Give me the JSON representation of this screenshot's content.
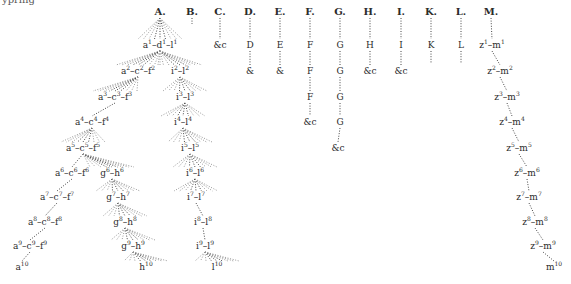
{
  "corner_text": "ypring",
  "species_headers": [
    "A.",
    "B.",
    "C.",
    "D.",
    "E.",
    "F.",
    "G.",
    "H.",
    "I.",
    "K.",
    "L.",
    "M."
  ],
  "nodes": [
    {
      "id": "A",
      "x": 160,
      "y": 12,
      "text": "A.",
      "head": true
    },
    {
      "id": "B",
      "x": 192,
      "y": 12,
      "text": "B.",
      "head": true
    },
    {
      "id": "C",
      "x": 220,
      "y": 12,
      "text": "C.",
      "head": true
    },
    {
      "id": "D",
      "x": 250,
      "y": 12,
      "text": "D.",
      "head": true
    },
    {
      "id": "E",
      "x": 280,
      "y": 12,
      "text": "E.",
      "head": true
    },
    {
      "id": "F",
      "x": 310,
      "y": 12,
      "text": "F.",
      "head": true
    },
    {
      "id": "G",
      "x": 340,
      "y": 12,
      "text": "G.",
      "head": true
    },
    {
      "id": "H",
      "x": 370,
      "y": 12,
      "text": "H.",
      "head": true
    },
    {
      "id": "I",
      "x": 401,
      "y": 12,
      "text": "I.",
      "head": true
    },
    {
      "id": "K",
      "x": 431,
      "y": 12,
      "text": "K.",
      "head": true
    },
    {
      "id": "L",
      "x": 461,
      "y": 12,
      "text": "L.",
      "head": true
    },
    {
      "id": "M",
      "x": 491,
      "y": 12,
      "text": "M.",
      "head": true
    },
    {
      "id": "C1",
      "x": 220,
      "y": 45,
      "text": "&c"
    },
    {
      "id": "D1",
      "x": 250,
      "y": 45,
      "text": "D"
    },
    {
      "id": "D2",
      "x": 250,
      "y": 71,
      "text": "&"
    },
    {
      "id": "E1",
      "x": 280,
      "y": 45,
      "text": "E"
    },
    {
      "id": "E2",
      "x": 280,
      "y": 71,
      "text": "&"
    },
    {
      "id": "F1",
      "x": 310,
      "y": 45,
      "text": "F"
    },
    {
      "id": "F2",
      "x": 310,
      "y": 71,
      "text": "F"
    },
    {
      "id": "F3",
      "x": 310,
      "y": 97,
      "text": "F"
    },
    {
      "id": "F4",
      "x": 310,
      "y": 122,
      "text": "&c"
    },
    {
      "id": "G1",
      "x": 340,
      "y": 45,
      "text": "G"
    },
    {
      "id": "G2",
      "x": 340,
      "y": 71,
      "text": "G"
    },
    {
      "id": "G3",
      "x": 340,
      "y": 97,
      "text": "G"
    },
    {
      "id": "G4",
      "x": 340,
      "y": 122,
      "text": "G"
    },
    {
      "id": "G5",
      "x": 338,
      "y": 148,
      "text": "&c"
    },
    {
      "id": "H1",
      "x": 370,
      "y": 45,
      "text": "H"
    },
    {
      "id": "H2",
      "x": 370,
      "y": 71,
      "text": "&c"
    },
    {
      "id": "I1",
      "x": 401,
      "y": 45,
      "text": "I"
    },
    {
      "id": "I2",
      "x": 401,
      "y": 71,
      "text": "&c"
    },
    {
      "id": "K1",
      "x": 431,
      "y": 45,
      "text": "K"
    },
    {
      "id": "L1",
      "x": 461,
      "y": 45,
      "text": "L"
    },
    {
      "id": "a1",
      "x": 160,
      "y": 45,
      "text": "a",
      "sup": "1",
      "rest": "–d",
      "sup2": "1",
      "rest2": "–l",
      "sup3": "1"
    },
    {
      "id": "a2",
      "x": 138,
      "y": 71,
      "text": "a",
      "sup": "2",
      "rest": "–c",
      "sup2": "2",
      "rest2": "–f",
      "sup3": "2"
    },
    {
      "id": "i2",
      "x": 180,
      "y": 71,
      "text": "i",
      "sup": "2",
      "rest": "–l",
      "sup2": "2"
    },
    {
      "id": "a3",
      "x": 115,
      "y": 97,
      "text": "a",
      "sup": "3",
      "rest": "–c",
      "sup2": "3",
      "rest2": "–f",
      "sup3": "3"
    },
    {
      "id": "i3",
      "x": 185,
      "y": 97,
      "text": "i",
      "sup": "3",
      "rest": "–l",
      "sup2": "3"
    },
    {
      "id": "a4",
      "x": 92,
      "y": 122,
      "text": "a",
      "sup": "4",
      "rest": "–c",
      "sup2": "4",
      "rest2": "–f",
      "sup3": "4"
    },
    {
      "id": "i4",
      "x": 183,
      "y": 122,
      "text": "i",
      "sup": "4",
      "rest": "–l",
      "sup2": "4"
    },
    {
      "id": "a5",
      "x": 83,
      "y": 148,
      "text": "a",
      "sup": "5",
      "rest": "–c",
      "sup2": "5",
      "rest2": "–f",
      "sup3": "5"
    },
    {
      "id": "i5",
      "x": 190,
      "y": 148,
      "text": "i",
      "sup": "5",
      "rest": "–l",
      "sup2": "5"
    },
    {
      "id": "a6",
      "x": 72,
      "y": 173,
      "text": "a",
      "sup": "6",
      "rest": "–c",
      "sup2": "6",
      "rest2": "–f",
      "sup3": "6"
    },
    {
      "id": "g6",
      "x": 112,
      "y": 173,
      "text": "g",
      "sup": "6",
      "rest": "–h",
      "sup2": "6"
    },
    {
      "id": "i6",
      "x": 195,
      "y": 173,
      "text": "i",
      "sup": "6",
      "rest": "–l",
      "sup2": "6"
    },
    {
      "id": "a7",
      "x": 57,
      "y": 197,
      "text": "a",
      "sup": "7",
      "rest": "–c",
      "sup2": "7",
      "rest2": "–f",
      "sup3": "7"
    },
    {
      "id": "g7",
      "x": 118,
      "y": 197,
      "text": "g",
      "sup": "7",
      "rest": "–h",
      "sup2": "7"
    },
    {
      "id": "i7",
      "x": 196,
      "y": 197,
      "text": "i",
      "sup": "7",
      "rest": "–l",
      "sup2": "7"
    },
    {
      "id": "a8",
      "x": 45,
      "y": 222,
      "text": "a",
      "sup": "8",
      "rest": "–c",
      "sup2": "8",
      "rest2": "–f",
      "sup3": "8"
    },
    {
      "id": "g8",
      "x": 125,
      "y": 222,
      "text": "g",
      "sup": "8",
      "rest": "–h",
      "sup2": "8"
    },
    {
      "id": "i8",
      "x": 203,
      "y": 222,
      "text": "i",
      "sup": "8",
      "rest": "–l",
      "sup2": "8"
    },
    {
      "id": "a9",
      "x": 30,
      "y": 246,
      "text": "a",
      "sup": "9",
      "rest": "–c",
      "sup2": "9",
      "rest2": "–f",
      "sup3": "9"
    },
    {
      "id": "g9",
      "x": 133,
      "y": 246,
      "text": "g",
      "sup": "9",
      "rest": "–h",
      "sup2": "9"
    },
    {
      "id": "i9",
      "x": 205,
      "y": 246,
      "text": "i",
      "sup": "9",
      "rest": "–l",
      "sup2": "9"
    },
    {
      "id": "a10",
      "x": 22,
      "y": 267,
      "text": "a",
      "sup": "10"
    },
    {
      "id": "h10",
      "x": 146,
      "y": 267,
      "text": "h",
      "sup": "10"
    },
    {
      "id": "l10",
      "x": 217,
      "y": 267,
      "text": "l",
      "sup": "10"
    },
    {
      "id": "z1",
      "x": 492,
      "y": 45,
      "text": "z",
      "sup": "1",
      "rest": "–m",
      "sup2": "1"
    },
    {
      "id": "z2",
      "x": 500,
      "y": 71,
      "text": "z",
      "sup": "2",
      "rest": "–m",
      "sup2": "2"
    },
    {
      "id": "z3",
      "x": 507,
      "y": 97,
      "text": "z",
      "sup": "3",
      "rest": "–m",
      "sup2": "3"
    },
    {
      "id": "z4",
      "x": 512,
      "y": 122,
      "text": "z",
      "sup": "4",
      "rest": "–m",
      "sup2": "4"
    },
    {
      "id": "z5",
      "x": 519,
      "y": 148,
      "text": "z",
      "sup": "5",
      "rest": "–m",
      "sup2": "5"
    },
    {
      "id": "z6",
      "x": 527,
      "y": 173,
      "text": "z",
      "sup": "6",
      "rest": "–m",
      "sup2": "6"
    },
    {
      "id": "z7",
      "x": 529,
      "y": 197,
      "text": "z",
      "sup": "7",
      "rest": "–m",
      "sup2": "7"
    },
    {
      "id": "z8",
      "x": 535,
      "y": 222,
      "text": "z",
      "sup": "8",
      "rest": "–m",
      "sup2": "8"
    },
    {
      "id": "z9",
      "x": 543,
      "y": 246,
      "text": "z",
      "sup": "9",
      "rest": "–m",
      "sup2": "9"
    },
    {
      "id": "m10",
      "x": 554,
      "y": 267,
      "text": "m",
      "sup": "10"
    }
  ],
  "edges": [
    [
      "A",
      "a1",
      "fan"
    ],
    [
      "B",
      "B_end",
      "line"
    ],
    [
      "C",
      "C1",
      "line"
    ],
    [
      "D",
      "D1",
      "line"
    ],
    [
      "D1",
      "D2",
      "line"
    ],
    [
      "E",
      "E1",
      "line"
    ],
    [
      "E1",
      "E2",
      "line"
    ],
    [
      "F",
      "F1",
      "line"
    ],
    [
      "F1",
      "F2",
      "line"
    ],
    [
      "F2",
      "F3",
      "line"
    ],
    [
      "F3",
      "F4",
      "line"
    ],
    [
      "G",
      "G1",
      "line"
    ],
    [
      "G1",
      "G2",
      "line"
    ],
    [
      "G2",
      "G3",
      "line"
    ],
    [
      "G3",
      "G4",
      "line"
    ],
    [
      "G4",
      "G5",
      "line"
    ],
    [
      "H",
      "H1",
      "line"
    ],
    [
      "H1",
      "H2",
      "line"
    ],
    [
      "I",
      "I1",
      "line"
    ],
    [
      "I1",
      "I2",
      "line"
    ],
    [
      "K",
      "K1",
      "line"
    ],
    [
      "K1",
      "K_end",
      "line"
    ],
    [
      "L",
      "L1",
      "line"
    ],
    [
      "L1",
      "L_end",
      "line"
    ],
    [
      "M",
      "z1",
      "line"
    ],
    [
      "a1",
      "a2",
      "fan"
    ],
    [
      "a1",
      "i2",
      "fan"
    ],
    [
      "a2",
      "a3",
      "fan"
    ],
    [
      "i2",
      "i3",
      "fan"
    ],
    [
      "a3",
      "a4",
      "line"
    ],
    [
      "i3",
      "i4",
      "fan"
    ],
    [
      "a4",
      "a5",
      "fan"
    ],
    [
      "i4",
      "i5",
      "fan"
    ],
    [
      "a5",
      "a6",
      "line"
    ],
    [
      "a5",
      "g6",
      "fan"
    ],
    [
      "i5",
      "i6",
      "fan"
    ],
    [
      "a6",
      "a7",
      "line"
    ],
    [
      "g6",
      "g7",
      "fan"
    ],
    [
      "i6",
      "i7",
      "fan"
    ],
    [
      "a7",
      "a8",
      "line"
    ],
    [
      "g7",
      "g8",
      "fan"
    ],
    [
      "i7",
      "i8",
      "line"
    ],
    [
      "a8",
      "a9",
      "line"
    ],
    [
      "g8",
      "g9",
      "fan"
    ],
    [
      "i8",
      "i9",
      "line"
    ],
    [
      "a9",
      "a10",
      "line"
    ],
    [
      "g9",
      "h10",
      "fan"
    ],
    [
      "i9",
      "l10",
      "fan"
    ],
    [
      "z1",
      "z2",
      "line"
    ],
    [
      "z2",
      "z3",
      "line"
    ],
    [
      "z3",
      "z4",
      "line"
    ],
    [
      "z4",
      "z5",
      "line"
    ],
    [
      "z5",
      "z6",
      "line"
    ],
    [
      "z6",
      "z7",
      "line"
    ],
    [
      "z7",
      "z8",
      "line"
    ],
    [
      "z8",
      "z9",
      "line"
    ],
    [
      "z9",
      "m10",
      "line"
    ]
  ],
  "endpoints": {
    "B_end": {
      "x": 192,
      "y": 30
    },
    "K_end": {
      "x": 431,
      "y": 70
    },
    "L_end": {
      "x": 461,
      "y": 70
    }
  },
  "colors": {
    "ink": "#2b2b2b",
    "line": "#444444",
    "faint": "#999999",
    "paper": "#ffffff"
  }
}
